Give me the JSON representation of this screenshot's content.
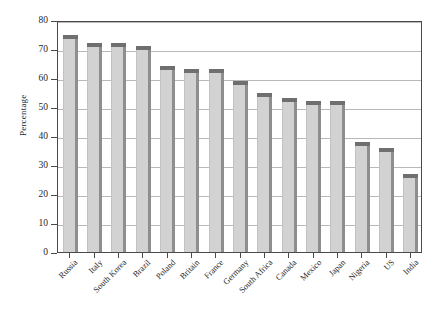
{
  "chart_data": {
    "type": "bar",
    "title": "",
    "subtitle": "",
    "xlabel": "",
    "ylabel": "Percentage",
    "ylim": [
      0,
      80
    ],
    "ytick_values": [
      0,
      10,
      20,
      30,
      40,
      50,
      60,
      70,
      80
    ],
    "ytick_labels": [
      "0",
      "10",
      "20",
      "30",
      "40",
      "50",
      "60",
      "70",
      "80"
    ],
    "grid": "horizontal",
    "legend": "none",
    "xtick_rotation": -45,
    "bar_style": "3d-shaded",
    "categories": [
      "Russia",
      "Italy",
      "South Korea",
      "Brazil",
      "Poland",
      "Britain",
      "France",
      "Germany",
      "South Africa",
      "Canada",
      "Mexico",
      "Japan",
      "Nigeria",
      "US",
      "India"
    ],
    "values": [
      75,
      72,
      72,
      71,
      64,
      63,
      63,
      59,
      55,
      53,
      52,
      52,
      38,
      36,
      27
    ],
    "series": [
      {
        "name": "Percentage",
        "values": [
          75,
          72,
          72,
          71,
          64,
          63,
          63,
          59,
          55,
          53,
          52,
          52,
          38,
          36,
          27
        ]
      }
    ]
  },
  "colors": {
    "bar_face": "#d2d2d2",
    "bar_top": "#6f6f6f",
    "bar_side": "#8e8e8e",
    "gridline": "#b9b9b9",
    "axis": "#4a4a4a",
    "text": "#1f1f1f",
    "background": "#ffffff"
  }
}
